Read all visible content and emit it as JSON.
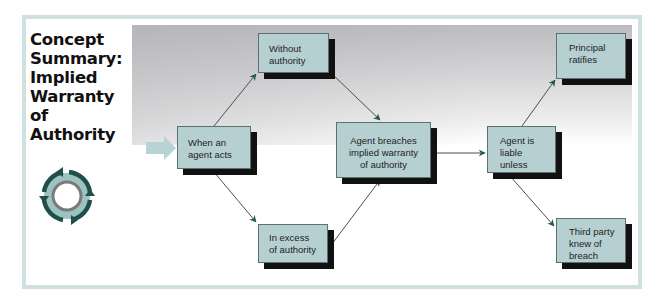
{
  "title": {
    "lines": [
      "Concept",
      "Summary:",
      "Implied",
      "Warranty",
      "of",
      "Authority"
    ]
  },
  "icons": {
    "cycle": "circular-arrows-icon",
    "entry": "right-arrow-icon"
  },
  "colors": {
    "frame": "#cfe0e0",
    "box_fill": "#b6d0d2",
    "box_shadow": "#111111",
    "arrow": "#1f5a52",
    "icon_ring": "#1f4f47",
    "icon_inner": "#9cc3c1"
  },
  "nodes": {
    "start": {
      "lines": [
        "When an",
        "agent acts"
      ]
    },
    "without": {
      "lines": [
        "Without",
        "authority"
      ]
    },
    "excess": {
      "lines": [
        "In excess",
        "of authority"
      ]
    },
    "breach": {
      "lines": [
        "Agent breaches",
        "implied warranty",
        "of authority"
      ]
    },
    "liable": {
      "lines": [
        "Agent is",
        "liable",
        "unless"
      ]
    },
    "ratifies": {
      "lines": [
        "Principal",
        "ratifies"
      ]
    },
    "knew": {
      "lines": [
        "Third party",
        "knew of",
        "breach"
      ]
    }
  },
  "edges": [
    {
      "from": "start",
      "to": "without"
    },
    {
      "from": "start",
      "to": "excess"
    },
    {
      "from": "without",
      "to": "breach"
    },
    {
      "from": "excess",
      "to": "breach"
    },
    {
      "from": "breach",
      "to": "liable"
    },
    {
      "from": "liable",
      "to": "ratifies"
    },
    {
      "from": "liable",
      "to": "knew"
    }
  ]
}
